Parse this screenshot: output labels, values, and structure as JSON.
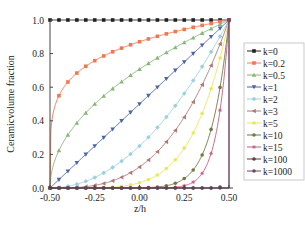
{
  "chart_data": {
    "type": "line",
    "title": "",
    "xlabel": "z/h",
    "ylabel": "Ceramicvolume fraction",
    "xlim": [
      -0.5,
      0.5
    ],
    "ylim": [
      0.0,
      1.0
    ],
    "xticks": [
      -0.5,
      -0.25,
      0.0,
      0.25,
      0.5
    ],
    "xtick_labels": [
      "-0.50",
      "-0.25",
      "0.00",
      "0.25",
      "0.50"
    ],
    "yticks": [
      0.0,
      0.2,
      0.4,
      0.6,
      0.8,
      1.0
    ],
    "ytick_labels": [
      "0.0",
      "0.2",
      "0.4",
      "0.6",
      "0.8",
      "1.0"
    ],
    "grid": false,
    "legend_position": "right-inside",
    "formula": "V = (z/h + 0.5)^k",
    "x": [
      -0.5,
      -0.45,
      -0.4,
      -0.35,
      -0.3,
      -0.25,
      -0.2,
      -0.15,
      -0.1,
      -0.05,
      0.0,
      0.05,
      0.1,
      0.15,
      0.2,
      0.25,
      0.3,
      0.35,
      0.4,
      0.45,
      0.5
    ],
    "series": [
      {
        "name": "k=0",
        "k": 0,
        "color": "#222222",
        "marker": "square",
        "values": [
          1,
          1,
          1,
          1,
          1,
          1,
          1,
          1,
          1,
          1,
          1,
          1,
          1,
          1,
          1,
          1,
          1,
          1,
          1,
          1,
          1
        ]
      },
      {
        "name": "k=0.2",
        "k": 0.2,
        "color": "#f07850",
        "marker": "square",
        "values": [
          0,
          0.631,
          0.725,
          0.786,
          0.833,
          0.871,
          0.903,
          0.931,
          0.956,
          0.979,
          0.871,
          0.903,
          0.931,
          0.956,
          0.979,
          0.944,
          0.956,
          0.967,
          0.978,
          0.989,
          1
        ]
      },
      {
        "name": "k=0.5",
        "k": 0.5,
        "color": "#88b878",
        "marker": "triangle-up",
        "values": [
          0,
          0.224,
          0.316,
          0.387,
          0.447,
          0.5,
          0.548,
          0.592,
          0.632,
          0.671,
          0.707,
          0.742,
          0.775,
          0.806,
          0.837,
          0.866,
          0.894,
          0.922,
          0.949,
          0.975,
          1
        ]
      },
      {
        "name": "k=1",
        "k": 1,
        "color": "#4a64a8",
        "marker": "triangle-down",
        "values": [
          0,
          0.05,
          0.1,
          0.15,
          0.2,
          0.25,
          0.3,
          0.35,
          0.4,
          0.45,
          0.5,
          0.55,
          0.6,
          0.65,
          0.7,
          0.75,
          0.8,
          0.85,
          0.9,
          0.95,
          1
        ]
      },
      {
        "name": "k=2",
        "k": 2,
        "color": "#9cd0e0",
        "marker": "diamond",
        "values": [
          0,
          0.0025,
          0.01,
          0.0225,
          0.04,
          0.0625,
          0.09,
          0.1225,
          0.16,
          0.2025,
          0.25,
          0.3025,
          0.36,
          0.4225,
          0.49,
          0.5625,
          0.64,
          0.7225,
          0.81,
          0.9025,
          1
        ]
      },
      {
        "name": "k=3",
        "k": 3,
        "color": "#b07878",
        "marker": "triangle-left",
        "values": [
          0,
          0.0001,
          0.001,
          0.0034,
          0.008,
          0.0156,
          0.027,
          0.0429,
          0.064,
          0.0911,
          0.125,
          0.1664,
          0.216,
          0.2746,
          0.343,
          0.4219,
          0.512,
          0.6141,
          0.729,
          0.8574,
          1
        ]
      },
      {
        "name": "k=5",
        "k": 5,
        "color": "#e8e858",
        "marker": "circle",
        "values": [
          0,
          0,
          0,
          0.0001,
          0.0003,
          0.001,
          0.0024,
          0.0053,
          0.0102,
          0.0185,
          0.0313,
          0.0503,
          0.0778,
          0.116,
          0.1681,
          0.2373,
          0.3277,
          0.4437,
          0.5905,
          0.7738,
          1
        ]
      },
      {
        "name": "k=10",
        "k": 10,
        "color": "#707a40",
        "marker": "circle",
        "values": [
          0,
          0,
          0,
          0,
          0,
          0,
          0,
          0,
          0.0001,
          0.0003,
          0.001,
          0.0025,
          0.006,
          0.0135,
          0.0282,
          0.0563,
          0.1074,
          0.1969,
          0.3487,
          0.5987,
          1
        ]
      },
      {
        "name": "k=15",
        "k": 15,
        "color": "#c86080",
        "marker": "star",
        "values": [
          0,
          0,
          0,
          0,
          0,
          0,
          0,
          0,
          0,
          0,
          0,
          0.0001,
          0.0005,
          0.0016,
          0.0047,
          0.0134,
          0.0352,
          0.0874,
          0.2059,
          0.4633,
          1
        ]
      },
      {
        "name": "k=100",
        "k": 100,
        "color": "#6a3838",
        "marker": "circle",
        "values": [
          0,
          0,
          0,
          0,
          0,
          0,
          0,
          0,
          0,
          0,
          0,
          0,
          0,
          0,
          0,
          0,
          0,
          0,
          0,
          0,
          1
        ]
      },
      {
        "name": "k=1000",
        "k": 1000,
        "color": "#6a4870",
        "marker": "circle",
        "values": [
          0,
          0,
          0,
          0,
          0,
          0,
          0,
          0,
          0,
          0,
          0,
          0,
          0,
          0,
          0,
          0,
          0,
          0,
          0,
          0,
          1
        ]
      }
    ]
  },
  "legend": {
    "items": [
      "k=0",
      "k=0.2",
      "k=0.5",
      "k=1",
      "k=2",
      "k=3",
      "k=5",
      "k=10",
      "k=15",
      "k=100",
      "k=1000"
    ]
  }
}
